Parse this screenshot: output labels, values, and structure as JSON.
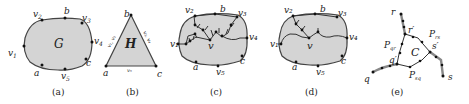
{
  "figure": {
    "panels": [
      {
        "id": "a",
        "caption": "(a)",
        "region_label": "G",
        "vertices": [
          "v2",
          "b",
          "v3",
          "v4",
          "c",
          "v5",
          "a",
          "v1"
        ]
      },
      {
        "id": "b",
        "caption": "(b)",
        "region_label": "H",
        "vertices": [
          "b",
          "a",
          "c"
        ],
        "edge_labels": {
          "left": "v1, v2",
          "right": "v3, v4",
          "bottom": "v5"
        }
      },
      {
        "id": "c",
        "caption": "(c)",
        "center_label": "v",
        "vertices": [
          "v2",
          "b",
          "v3",
          "v4",
          "c",
          "v5",
          "a",
          "v1"
        ]
      },
      {
        "id": "d",
        "caption": "(d)",
        "center_label": "v",
        "vertices": [
          "v2",
          "b",
          "v3",
          "v4",
          "c",
          "v5",
          "a",
          "v1"
        ]
      },
      {
        "id": "e",
        "caption": "(e)",
        "region_label": "C",
        "vertices": [
          "r",
          "r'",
          "s'",
          "s",
          "q'",
          "q"
        ],
        "path_labels": [
          "P_qr",
          "P_rs",
          "P_sq"
        ]
      }
    ]
  },
  "labels": {
    "a": {
      "G": "G",
      "v1": "v",
      "v1s": "1",
      "v2": "v",
      "v2s": "2",
      "v3": "v",
      "v3s": "3",
      "v4": "v",
      "v4s": "4",
      "v5": "v",
      "v5s": "5",
      "a": "a",
      "b": "b",
      "c": "c",
      "cap": "(a)"
    },
    "b": {
      "H": "H",
      "a": "a",
      "b": "b",
      "c": "c",
      "left": "v₁, v₂",
      "right": "v₃, v₄",
      "bottom": "v₅",
      "cap": "(b)"
    },
    "c": {
      "v": "v",
      "v1": "v₁",
      "v2": "v₂",
      "v3": "v₃",
      "v4": "v₄",
      "v5": "v₅",
      "a": "a",
      "b": "b",
      "c": "c",
      "cap": "(c)"
    },
    "d": {
      "v": "v",
      "v1": "v₁",
      "v2": "v₂",
      "v3": "v₃",
      "v4": "v₄",
      "v5": "v₅",
      "a": "a",
      "b": "b",
      "c": "c",
      "cap": "(d)"
    },
    "e": {
      "r": "r",
      "rp": "r′",
      "sp": "s′",
      "s": "s",
      "qp": "q′",
      "q": "q",
      "C": "C",
      "Pqr": "P",
      "Pqr_s": "qr",
      "Prs": "P",
      "Prs_s": "rs",
      "Psq": "P",
      "Psq_s": "sq",
      "cap": "(e)"
    }
  }
}
